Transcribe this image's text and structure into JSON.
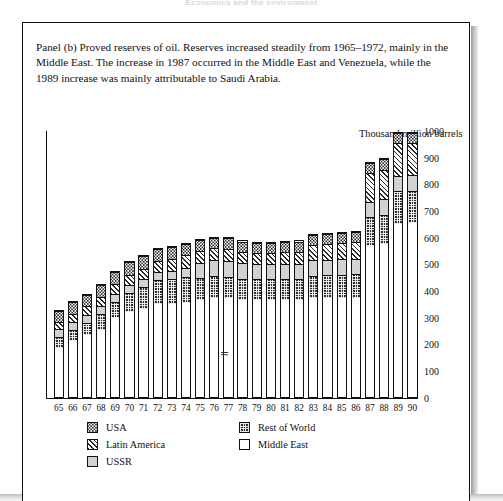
{
  "running_head": "Economics and the environment",
  "caption": "Panel (b)  Proved reserves of oil. Reserves increased steadily from 1965–1972, mainly in the Middle East. The increase in 1987 occurred in the Middle East and Venezuela, while the 1989 increase was mainly attributable to Saudi Arabia.",
  "panel_label": "Panel (b)",
  "axis_note_artifact": "≂",
  "colors": {
    "ink": "#111111",
    "middle_east": "#ffffff",
    "rest_of_world": "#2f2f2f",
    "ussr": "#d2d2d2",
    "latin_america": "#ffffff",
    "usa": "#ffffff",
    "page_background": "#ffffff"
  },
  "legend": {
    "column_a": [
      {
        "label": "USA",
        "key": "usa",
        "swatch": "dotted"
      },
      {
        "label": "Latin America",
        "key": "latin_america",
        "swatch": "diagonal-hatch"
      },
      {
        "label": "USSR",
        "key": "ussr",
        "swatch": "light-grey"
      }
    ],
    "column_b": [
      {
        "label": "Rest of World",
        "key": "rest_of_world",
        "swatch": "dark-checker"
      },
      {
        "label": "Middle East",
        "key": "middle_east",
        "swatch": "white"
      }
    ]
  },
  "chart_data": {
    "type": "bar",
    "stacked": true,
    "title": "Proved reserves of oil",
    "subtitle": "",
    "xlabel": "",
    "ylabel": "Thousand million barrels",
    "ylim": [
      0,
      1000
    ],
    "yticks": [
      0,
      100,
      200,
      300,
      400,
      500,
      600,
      700,
      800,
      900,
      1000
    ],
    "ytick_labels": [
      "0",
      "100",
      "200",
      "300",
      "400",
      "500",
      "600",
      "700",
      "800",
      "900",
      "1000"
    ],
    "grid": false,
    "legend_position": "below-plot",
    "categories": [
      "65",
      "66",
      "67",
      "68",
      "69",
      "70",
      "71",
      "72",
      "73",
      "74",
      "75",
      "76",
      "77",
      "78",
      "79",
      "80",
      "81",
      "82",
      "83",
      "84",
      "85",
      "86",
      "87",
      "88",
      "89",
      "90"
    ],
    "stack_order_bottom_to_top": [
      "Middle East",
      "Rest of World",
      "USSR",
      "Latin America",
      "USA"
    ],
    "series": [
      {
        "name": "Middle East",
        "key": "middle_east",
        "values": [
          182,
          208,
          232,
          252,
          295,
          318,
          330,
          348,
          348,
          350,
          362,
          372,
          372,
          362,
          362,
          362,
          362,
          362,
          372,
          372,
          372,
          372,
          565,
          572,
          648,
          650
        ]
      },
      {
        "name": "Rest of World",
        "key": "rest_of_world",
        "values": [
          42,
          44,
          45,
          58,
          60,
          72,
          80,
          88,
          95,
          100,
          82,
          80,
          78,
          80,
          78,
          78,
          78,
          78,
          82,
          84,
          86,
          88,
          108,
          110,
          122,
          122
        ]
      },
      {
        "name": "USSR",
        "key": "ussr",
        "values": [
          30,
          30,
          30,
          30,
          30,
          30,
          30,
          30,
          30,
          34,
          58,
          60,
          60,
          58,
          58,
          58,
          58,
          58,
          58,
          58,
          58,
          58,
          58,
          58,
          58,
          58
        ]
      },
      {
        "name": "Latin America",
        "key": "latin_america",
        "values": [
          28,
          30,
          32,
          34,
          36,
          38,
          40,
          42,
          44,
          46,
          44,
          44,
          44,
          42,
          42,
          42,
          44,
          46,
          56,
          58,
          60,
          62,
          108,
          112,
          122,
          122
        ]
      },
      {
        "name": "USA",
        "key": "usa",
        "values": [
          40,
          42,
          44,
          44,
          46,
          46,
          46,
          46,
          44,
          42,
          40,
          40,
          40,
          40,
          38,
          38,
          38,
          38,
          38,
          38,
          38,
          38,
          38,
          38,
          38,
          38
        ]
      }
    ],
    "totals": [
      322,
      354,
      383,
      418,
      467,
      504,
      526,
      554,
      561,
      572,
      586,
      596,
      594,
      582,
      578,
      578,
      580,
      582,
      606,
      610,
      614,
      618,
      877,
      890,
      988,
      990
    ]
  }
}
